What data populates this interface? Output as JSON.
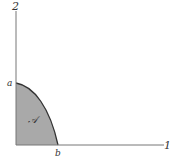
{
  "diagram": {
    "axes": {
      "vertical_label": "2",
      "horizontal_label": "1"
    },
    "points": {
      "a_label": "a",
      "b_label": "b"
    },
    "region": {
      "label": "𝒜",
      "fill_color": "#a9a9a9"
    },
    "colors": {
      "axis": "#777777",
      "curve": "#333333"
    }
  }
}
